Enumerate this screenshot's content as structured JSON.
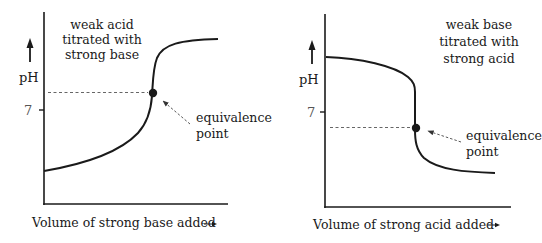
{
  "diagrams": [
    {
      "id": "left",
      "title_lines": [
        "weak acid",
        "titrated with",
        "strong base"
      ],
      "y_axis_label": "pH",
      "y_tick_label": "7",
      "x_axis_label": "Volume of strong base added",
      "x_axis_arrow": "→",
      "annotation_lines": [
        "equivalence",
        "point"
      ],
      "curve_shape": "increasing S-curve (sigmoid), equivalence point above pH 7"
    },
    {
      "id": "right",
      "title_lines": [
        "weak base",
        "titrated with",
        "strong acid"
      ],
      "y_axis_label": "pH",
      "y_tick_label": "7",
      "x_axis_label": "Volume of strong acid added",
      "x_axis_arrow": "→",
      "annotation_lines": [
        "equivalence",
        "point"
      ],
      "curve_shape": "decreasing S-curve (reverse sigmoid), equivalence point below pH 7"
    }
  ],
  "colors": {
    "ink": "#1a1a1a",
    "dashed": "#555555",
    "background": "#ffffff"
  }
}
